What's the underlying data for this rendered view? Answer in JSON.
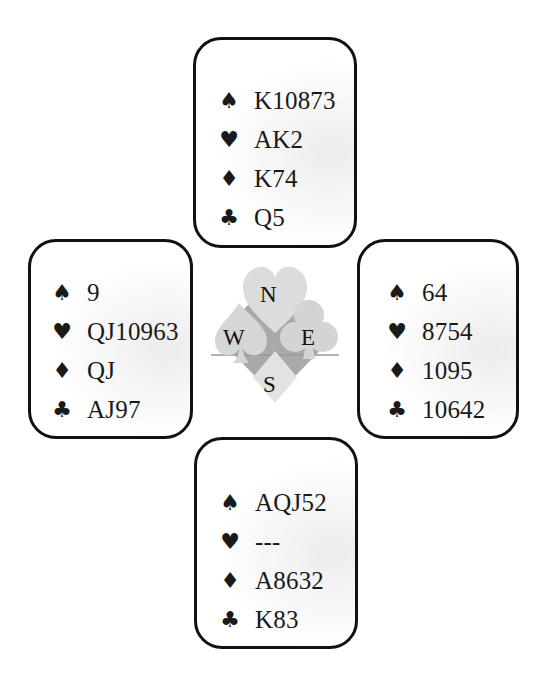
{
  "hands": {
    "north": {
      "spades": "K10873",
      "hearts": "AK2",
      "diamonds": "K74",
      "clubs": "Q5"
    },
    "west": {
      "spades": "9",
      "hearts": "QJ10963",
      "diamonds": "QJ",
      "clubs": "AJ97"
    },
    "east": {
      "spades": "64",
      "hearts": "8754",
      "diamonds": "1095",
      "clubs": "10642"
    },
    "south": {
      "spades": "AQJ52",
      "hearts": "---",
      "diamonds": "A8632",
      "clubs": "K83"
    }
  },
  "suit_symbols": {
    "spades": "♠",
    "hearts": "♥",
    "diamonds": "♦",
    "clubs": "♣"
  },
  "compass": {
    "north": "N",
    "south": "S",
    "east": "E",
    "west": "W"
  },
  "colors": {
    "border": "#111111",
    "logo_light": "#d9d9d9",
    "logo_dark": "#a6a6a6"
  }
}
